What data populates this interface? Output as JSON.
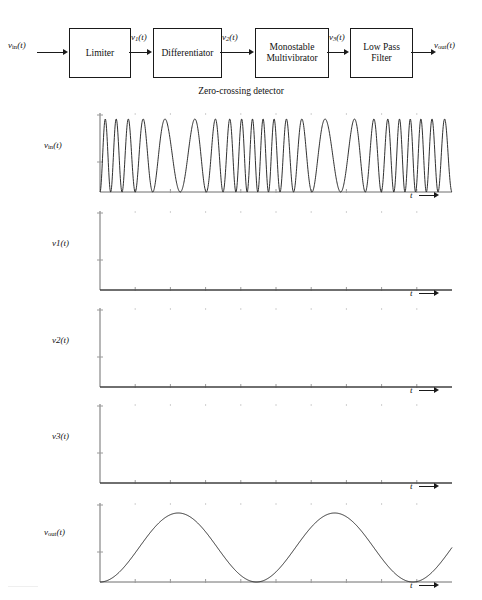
{
  "figure": {
    "caption": "Zero-crossing detector"
  },
  "block_diagram": {
    "blocks": [
      {
        "id": "limiter",
        "label": "Limiter",
        "x": 69,
        "y": 28,
        "w": 60,
        "h": 48
      },
      {
        "id": "differentiator",
        "label": "Differentiator",
        "x": 153,
        "y": 28,
        "w": 67,
        "h": 48
      },
      {
        "id": "monostable",
        "label": "Monostable\nMultivibrator",
        "x": 255,
        "y": 28,
        "w": 72,
        "h": 48
      },
      {
        "id": "lowpass",
        "label": "Low Pass\nFilter",
        "x": 350,
        "y": 28,
        "w": 61,
        "h": 48
      }
    ],
    "signals": [
      {
        "id": "v_in",
        "base": "v",
        "sub": "in",
        "suffix": "(t)",
        "x": 8,
        "y": 40
      },
      {
        "id": "v1",
        "base": "v",
        "sub": "1",
        "suffix": "(t)",
        "x": 131,
        "y": 32
      },
      {
        "id": "v2",
        "base": "v",
        "sub": "2",
        "suffix": "(t)",
        "x": 222,
        "y": 32
      },
      {
        "id": "v3",
        "base": "v",
        "sub": "3",
        "suffix": "(t)",
        "x": 329,
        "y": 32
      },
      {
        "id": "v_out",
        "base": "v",
        "sub": "out",
        "suffix": "(t)",
        "x": 434,
        "y": 40
      }
    ]
  },
  "axis_label_t": "t",
  "panels": [
    {
      "id": "v_in_panel",
      "label_base": "v",
      "label_sub": "in",
      "label_suffix": "(t)",
      "top": 105,
      "trace": "fm_carrier",
      "ylab_y": 140
    },
    {
      "id": "v1_panel",
      "label_base": "v",
      "label_sub": "1",
      "label_suffix": "(t)",
      "top": 203,
      "trace": "square",
      "ylab_y": 238
    },
    {
      "id": "v2_panel",
      "label_base": "v",
      "label_sub": "2",
      "label_suffix": "(t)",
      "top": 300,
      "trace": "spikes",
      "ylab_y": 335
    },
    {
      "id": "v3_panel",
      "label_base": "v",
      "label_sub": "3",
      "label_suffix": "(t)",
      "top": 396,
      "trace": "monopulses",
      "ylab_y": 431
    },
    {
      "id": "v_out_panel",
      "label_base": "v",
      "label_sub": "out",
      "label_suffix": "(t)",
      "top": 495,
      "trace": "recovered_sine",
      "ylab_y": 527
    }
  ],
  "colors": {
    "line": "#1a1a1a",
    "axis": "#6e6e6e",
    "tick": "#9a9a9a",
    "background": "#ffffff"
  },
  "chart_data": {
    "type": "line",
    "xlabel": "t",
    "ylabel": "",
    "grid": false,
    "legend": "none",
    "x_axis_left_px": 100,
    "x_axis_right_px": 452,
    "modulation": {
      "description": "Carrier frequency varies sinusoidally with the modulating signal (FM).",
      "modulating_cycles": 2.25,
      "carrier_cycles_total": 23,
      "carrier_freq_min_rel": 0.55,
      "carrier_freq_max_rel": 1.65
    },
    "zero_crossing_times_norm": [
      0.008,
      0.036,
      0.062,
      0.088,
      0.116,
      0.146,
      0.18,
      0.22,
      0.266,
      0.316,
      0.364,
      0.406,
      0.442,
      0.474,
      0.503,
      0.53,
      0.556,
      0.582,
      0.61,
      0.64,
      0.674,
      0.714,
      0.76,
      0.81,
      0.858,
      0.9,
      0.936,
      0.968,
      0.996
    ],
    "series": [
      {
        "name": "v_in(t)",
        "type": "fm_carrier",
        "ylim": [
          -1,
          1
        ],
        "amplitude": 1.0,
        "note": "frequency-modulated sinusoid, constant amplitude"
      },
      {
        "name": "v1(t)",
        "type": "square",
        "ylim": [
          0,
          1
        ],
        "high": 1.0,
        "low": 0.0,
        "duty_percent": 50,
        "note": "limiter output: hard-limited square wave, same zero crossings"
      },
      {
        "name": "v2(t)",
        "type": "spikes",
        "ylim": [
          0,
          1
        ],
        "spike_height": 1.0,
        "spike_width_norm": 0.0025,
        "note": "differentiator output: narrow impulse at each rising edge"
      },
      {
        "name": "v3(t)",
        "type": "monopulses",
        "ylim": [
          0,
          1
        ],
        "pulse_height": 1.0,
        "pulse_width_norm": 0.01,
        "note": "monostable output: constant-width, constant-height pulses"
      },
      {
        "name": "v_out(t)",
        "type": "recovered_sine",
        "ylim": [
          0,
          1
        ],
        "cycles": 2.25,
        "dc_offset": 0.5,
        "amplitude": 0.5,
        "note": "low-pass filter output: recovered modulating sine wave"
      }
    ],
    "tick_count_x": 10
  }
}
